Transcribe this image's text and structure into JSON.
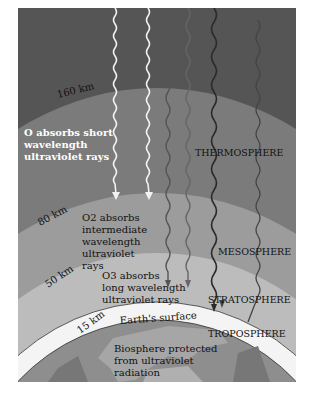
{
  "layers": {
    "thermosphere": "THERMOSPHERE",
    "mesosphere": "MESOSPHERE",
    "stratosphere": "STRATOSPHERE",
    "troposphere": "TROPOSPHERE"
  },
  "altitudes": {
    "a160": "160 km",
    "a80": "80 km",
    "a50": "50 km",
    "a15": "15 km"
  },
  "absorption": {
    "o": [
      "O absorbs short",
      "wavelength",
      "ultraviolet rays"
    ],
    "o2": [
      "O2 absorbs",
      "intermediate",
      "wavelength",
      "ultraviolet",
      "rays"
    ],
    "o3": [
      "O3 absorbs",
      "long wavelength",
      "ultraviolet rays"
    ]
  },
  "surface": {
    "label": "Earth's surface",
    "biosphere": [
      "Biosphere protected",
      "from ultraviolet",
      "radiation"
    ]
  },
  "colors": {
    "space": "#555555",
    "thermosphere": "#7b7b7b",
    "mesosphere": "#9c9c9c",
    "stratosphere": "#bcbcbc",
    "troposphere": "#f4f4f4",
    "earth": "#8e8e8e"
  }
}
